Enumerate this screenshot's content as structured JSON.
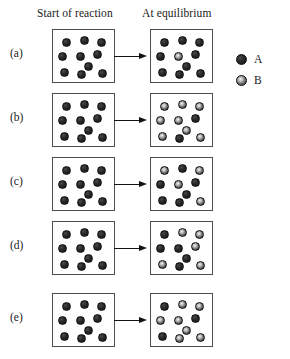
{
  "headers": {
    "start": "Start of reaction",
    "equilibrium": "At equilibrium"
  },
  "legend": {
    "items": [
      {
        "label": "A",
        "type": "A",
        "color": "#1c1c1c",
        "description": "solid dark sphere"
      },
      {
        "label": "B",
        "type": "B",
        "color": "#8a8a8a",
        "description": "dark sphere with light center"
      }
    ]
  },
  "chart_data": {
    "type": "scatter",
    "xlabel": "",
    "ylabel": "",
    "legend_position": "right",
    "grid": false,
    "species": [
      "A",
      "B"
    ],
    "total_particles_per_box": 10,
    "rows": [
      {
        "label": "(a)",
        "start": {
          "counts": {
            "A": 10,
            "B": 0
          },
          "particles": [
            {
              "type": "A",
              "x": 9,
              "y": 8
            },
            {
              "type": "A",
              "x": 27,
              "y": 6
            },
            {
              "type": "A",
              "x": 44,
              "y": 8
            },
            {
              "type": "A",
              "x": 5,
              "y": 22
            },
            {
              "type": "A",
              "x": 23,
              "y": 22
            },
            {
              "type": "A",
              "x": 40,
              "y": 20
            },
            {
              "type": "A",
              "x": 31,
              "y": 32
            },
            {
              "type": "A",
              "x": 7,
              "y": 38
            },
            {
              "type": "A",
              "x": 24,
              "y": 40
            },
            {
              "type": "A",
              "x": 45,
              "y": 39
            }
          ]
        },
        "equilibrium": {
          "counts": {
            "A": 9,
            "B": 1
          },
          "particles": [
            {
              "type": "A",
              "x": 9,
              "y": 8
            },
            {
              "type": "A",
              "x": 27,
              "y": 6
            },
            {
              "type": "A",
              "x": 44,
              "y": 8
            },
            {
              "type": "A",
              "x": 5,
              "y": 22
            },
            {
              "type": "B",
              "x": 23,
              "y": 22
            },
            {
              "type": "A",
              "x": 40,
              "y": 20
            },
            {
              "type": "A",
              "x": 31,
              "y": 32
            },
            {
              "type": "A",
              "x": 7,
              "y": 38
            },
            {
              "type": "A",
              "x": 24,
              "y": 40
            },
            {
              "type": "A",
              "x": 45,
              "y": 39
            }
          ]
        }
      },
      {
        "label": "(b)",
        "start": {
          "counts": {
            "A": 10,
            "B": 0
          },
          "particles": [
            {
              "type": "A",
              "x": 9,
              "y": 8
            },
            {
              "type": "A",
              "x": 27,
              "y": 6
            },
            {
              "type": "A",
              "x": 44,
              "y": 8
            },
            {
              "type": "A",
              "x": 5,
              "y": 22
            },
            {
              "type": "A",
              "x": 23,
              "y": 22
            },
            {
              "type": "A",
              "x": 40,
              "y": 20
            },
            {
              "type": "A",
              "x": 31,
              "y": 32
            },
            {
              "type": "A",
              "x": 7,
              "y": 38
            },
            {
              "type": "A",
              "x": 24,
              "y": 40
            },
            {
              "type": "A",
              "x": 45,
              "y": 39
            }
          ]
        },
        "equilibrium": {
          "counts": {
            "A": 2,
            "B": 8
          },
          "particles": [
            {
              "type": "B",
              "x": 9,
              "y": 8
            },
            {
              "type": "B",
              "x": 27,
              "y": 6
            },
            {
              "type": "B",
              "x": 44,
              "y": 8
            },
            {
              "type": "B",
              "x": 5,
              "y": 22
            },
            {
              "type": "B",
              "x": 23,
              "y": 22
            },
            {
              "type": "A",
              "x": 40,
              "y": 20
            },
            {
              "type": "B",
              "x": 31,
              "y": 32
            },
            {
              "type": "B",
              "x": 7,
              "y": 38
            },
            {
              "type": "A",
              "x": 24,
              "y": 40
            },
            {
              "type": "B",
              "x": 45,
              "y": 39
            }
          ]
        }
      },
      {
        "label": "(c)",
        "start": {
          "counts": {
            "A": 10,
            "B": 0
          },
          "particles": [
            {
              "type": "A",
              "x": 9,
              "y": 8
            },
            {
              "type": "A",
              "x": 27,
              "y": 6
            },
            {
              "type": "A",
              "x": 44,
              "y": 8
            },
            {
              "type": "A",
              "x": 5,
              "y": 22
            },
            {
              "type": "A",
              "x": 23,
              "y": 22
            },
            {
              "type": "A",
              "x": 40,
              "y": 20
            },
            {
              "type": "A",
              "x": 31,
              "y": 32
            },
            {
              "type": "A",
              "x": 7,
              "y": 38
            },
            {
              "type": "A",
              "x": 24,
              "y": 40
            },
            {
              "type": "A",
              "x": 45,
              "y": 39
            }
          ]
        },
        "equilibrium": {
          "counts": {
            "A": 6,
            "B": 4
          },
          "particles": [
            {
              "type": "B",
              "x": 9,
              "y": 8
            },
            {
              "type": "A",
              "x": 27,
              "y": 6
            },
            {
              "type": "B",
              "x": 44,
              "y": 8
            },
            {
              "type": "A",
              "x": 5,
              "y": 22
            },
            {
              "type": "B",
              "x": 23,
              "y": 22
            },
            {
              "type": "A",
              "x": 40,
              "y": 20
            },
            {
              "type": "A",
              "x": 31,
              "y": 32
            },
            {
              "type": "A",
              "x": 7,
              "y": 38
            },
            {
              "type": "A",
              "x": 24,
              "y": 40
            },
            {
              "type": "B",
              "x": 45,
              "y": 39
            }
          ]
        }
      },
      {
        "label": "(d)",
        "start": {
          "counts": {
            "A": 10,
            "B": 0
          },
          "particles": [
            {
              "type": "A",
              "x": 9,
              "y": 8
            },
            {
              "type": "A",
              "x": 27,
              "y": 6
            },
            {
              "type": "A",
              "x": 44,
              "y": 8
            },
            {
              "type": "A",
              "x": 5,
              "y": 22
            },
            {
              "type": "A",
              "x": 23,
              "y": 22
            },
            {
              "type": "A",
              "x": 40,
              "y": 20
            },
            {
              "type": "A",
              "x": 31,
              "y": 32
            },
            {
              "type": "A",
              "x": 7,
              "y": 38
            },
            {
              "type": "A",
              "x": 24,
              "y": 40
            },
            {
              "type": "A",
              "x": 45,
              "y": 39
            }
          ]
        },
        "equilibrium": {
          "counts": {
            "A": 5,
            "B": 5
          },
          "particles": [
            {
              "type": "A",
              "x": 9,
              "y": 8
            },
            {
              "type": "B",
              "x": 27,
              "y": 6
            },
            {
              "type": "B",
              "x": 44,
              "y": 8
            },
            {
              "type": "A",
              "x": 5,
              "y": 22
            },
            {
              "type": "A",
              "x": 23,
              "y": 22
            },
            {
              "type": "B",
              "x": 40,
              "y": 20
            },
            {
              "type": "A",
              "x": 31,
              "y": 32
            },
            {
              "type": "B",
              "x": 7,
              "y": 38
            },
            {
              "type": "A",
              "x": 24,
              "y": 40
            },
            {
              "type": "B",
              "x": 45,
              "y": 39
            }
          ]
        }
      },
      {
        "label": "(e)",
        "start": {
          "counts": {
            "A": 10,
            "B": 0
          },
          "particles": [
            {
              "type": "A",
              "x": 9,
              "y": 8
            },
            {
              "type": "A",
              "x": 27,
              "y": 6
            },
            {
              "type": "A",
              "x": 44,
              "y": 8
            },
            {
              "type": "A",
              "x": 5,
              "y": 22
            },
            {
              "type": "A",
              "x": 23,
              "y": 22
            },
            {
              "type": "A",
              "x": 40,
              "y": 20
            },
            {
              "type": "A",
              "x": 31,
              "y": 32
            },
            {
              "type": "A",
              "x": 7,
              "y": 38
            },
            {
              "type": "A",
              "x": 24,
              "y": 40
            },
            {
              "type": "A",
              "x": 45,
              "y": 39
            }
          ]
        },
        "equilibrium": {
          "counts": {
            "A": 3,
            "B": 7
          },
          "particles": [
            {
              "type": "A",
              "x": 9,
              "y": 8
            },
            {
              "type": "B",
              "x": 27,
              "y": 6
            },
            {
              "type": "B",
              "x": 44,
              "y": 8
            },
            {
              "type": "B",
              "x": 5,
              "y": 22
            },
            {
              "type": "B",
              "x": 23,
              "y": 22
            },
            {
              "type": "A",
              "x": 40,
              "y": 20
            },
            {
              "type": "B",
              "x": 31,
              "y": 32
            },
            {
              "type": "A",
              "x": 7,
              "y": 38
            },
            {
              "type": "B",
              "x": 24,
              "y": 40
            },
            {
              "type": "B",
              "x": 45,
              "y": 39
            }
          ]
        }
      }
    ]
  }
}
